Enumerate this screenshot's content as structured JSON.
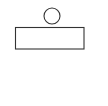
{
  "diagram": {
    "background": "#ffffff",
    "stroke_color": "#333333",
    "shapes": [
      {
        "type": "circle",
        "name": "circle",
        "cx": 52,
        "cy": 16,
        "r": 8
      },
      {
        "type": "rectangle",
        "name": "rectangle",
        "x": 15.5,
        "y": 27.5,
        "width": 68.5,
        "height": 21.5
      }
    ]
  }
}
